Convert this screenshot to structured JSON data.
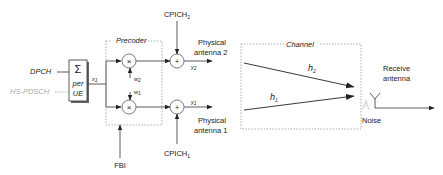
{
  "diagram": {
    "inputs": {
      "dpch": "DPCH",
      "hs_pdsch": "HS-PDSCH"
    },
    "summer": {
      "symbol": "Σ",
      "line1": "per",
      "line2": "UE"
    },
    "signal_x": {
      "base": "x",
      "sub": "1"
    },
    "precoder": {
      "title": "Precoder",
      "multiplier_symbol": "×",
      "w2": {
        "base": "w",
        "sub": "2"
      },
      "w1": {
        "base": "w",
        "sub": "1"
      }
    },
    "fbi": "FBI",
    "adders": {
      "symbol": "+",
      "cpich2": {
        "base": "CPICH",
        "sub": "2"
      },
      "cpich1": {
        "base": "CPICH",
        "sub": "1"
      }
    },
    "outputs": {
      "y2": {
        "base": "y",
        "sub": "2"
      },
      "y1": {
        "base": "y",
        "sub": "1"
      },
      "antenna2_line1": "Physical",
      "antenna2_line2": "antenna 2",
      "antenna1_line1": "Physical",
      "antenna1_line2": "antenna 1"
    },
    "channel": {
      "title": "Channel",
      "h2": {
        "base": "h",
        "sub": "2"
      },
      "h1": {
        "base": "h",
        "sub": "1"
      }
    },
    "receiver": {
      "line1": "Receive",
      "line2": "antenna",
      "noise": "Noise"
    }
  }
}
